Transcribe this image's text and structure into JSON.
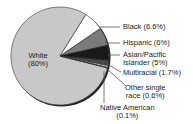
{
  "chart_data": {
    "type": "pie",
    "title": "",
    "slices": [
      {
        "label": "White",
        "value": 80,
        "display": "White",
        "pct": "(80%)",
        "color": "#c8c8c8"
      },
      {
        "label": "Black",
        "value": 6.6,
        "display": "Black (6.6%)",
        "color": "#ffffff"
      },
      {
        "label": "Hispanic",
        "value": 6,
        "display": "Hispanic (6%)",
        "color": "#7a7a7a"
      },
      {
        "label": "Asian/Pacific Islander",
        "value": 5,
        "display1": "Asian/Pacific",
        "display2": "Islander (5%)",
        "color": "#1a1a1a"
      },
      {
        "label": "Multiracial",
        "value": 1.7,
        "display": "Multiracial (1.7%)",
        "color": "#4a4a4a"
      },
      {
        "label": "Other single race",
        "value": 0.6,
        "display1": "Other single",
        "display2": "race (0.6%)",
        "color": "#e8e8e8"
      },
      {
        "label": "Native American",
        "value": 0.1,
        "display1": "Native American",
        "display2": "(0.1%)",
        "color": "#000000"
      }
    ],
    "legend_position": "right, leader lines"
  }
}
